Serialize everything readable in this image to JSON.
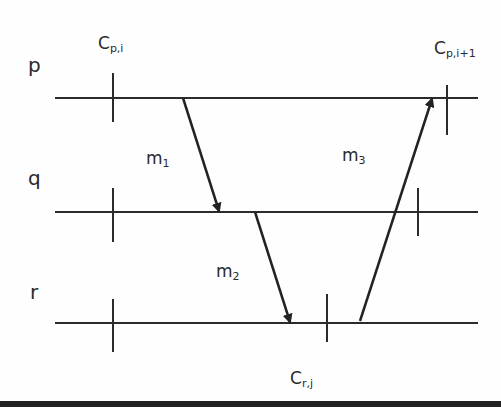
{
  "diagram": {
    "type": "space-time message diagram",
    "processes": [
      {
        "id": "p",
        "label": "p",
        "y": 98
      },
      {
        "id": "q",
        "label": "q",
        "y": 212
      },
      {
        "id": "r",
        "label": "r",
        "y": 323
      }
    ],
    "checkpoints": [
      {
        "process": "p",
        "label_main": "C",
        "label_sub": "p,i",
        "x": 113
      },
      {
        "process": "p",
        "label_main": "C",
        "label_sub": "p,i+1",
        "x": 447
      },
      {
        "process": "q",
        "label_main": "",
        "label_sub": "",
        "x": 113
      },
      {
        "process": "q",
        "label_main": "",
        "label_sub": "",
        "x": 418
      },
      {
        "process": "r",
        "label_main": "",
        "label_sub": "",
        "x": 113
      },
      {
        "process": "r",
        "label_main": "C",
        "label_sub": "r,j",
        "x": 327
      }
    ],
    "messages": [
      {
        "label_main": "m",
        "label_sub": "1",
        "from": "p",
        "to": "q",
        "x1": 183,
        "y1": 98,
        "x2": 219,
        "y2": 211
      },
      {
        "label_main": "m",
        "label_sub": "2",
        "from": "q",
        "to": "r",
        "x1": 255,
        "y1": 212,
        "x2": 290,
        "y2": 322
      },
      {
        "label_main": "m",
        "label_sub": "3",
        "from": "r",
        "to": "p",
        "x1": 360,
        "y1": 321,
        "x2": 432,
        "y2": 99
      }
    ],
    "colors": {
      "line": "#2b2b2b",
      "text": "#2a2a2a",
      "background": "#fefefe"
    }
  }
}
